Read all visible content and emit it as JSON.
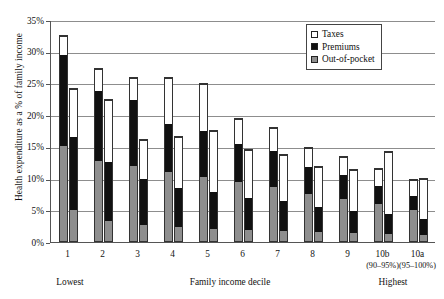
{
  "chart_data": {
    "type": "bar",
    "subtype": "grouped-stacked",
    "title": "",
    "xlabel": "Family income decile",
    "ylabel": "Health expenditure as a % of family income",
    "ylim": [
      0,
      35
    ],
    "ytick_values": [
      0,
      5,
      10,
      15,
      20,
      25,
      30,
      35
    ],
    "ytick_labels": [
      "0%",
      "5%",
      "10%",
      "15%",
      "20%",
      "25%",
      "30%",
      "35%"
    ],
    "grid": true,
    "grid_axis": "y",
    "legend_position": "top-right",
    "categories": [
      "1",
      "2",
      "3",
      "4",
      "5",
      "6",
      "7",
      "8",
      "9",
      "10b",
      "10a"
    ],
    "category_sublabels": [
      "",
      "",
      "",
      "",
      "",
      "",
      "",
      "",
      "",
      "(90–95%)",
      "(95–100%)"
    ],
    "axis_end_labels": {
      "left": "Lowest",
      "right": "Highest"
    },
    "bars_per_category": 2,
    "bar_series_names": [
      "bar-a",
      "bar-b"
    ],
    "stack_order_bottom_to_top": [
      "Out-of-pocket",
      "Premiums",
      "Taxes"
    ],
    "series": [
      {
        "name": "Out-of-pocket",
        "color": "#8e8e8e",
        "bar_a": [
          15.2,
          12.8,
          12.0,
          11.0,
          10.3,
          9.4,
          8.6,
          7.5,
          6.8,
          6.0,
          5.0
        ],
        "bar_b": [
          5.0,
          3.2,
          2.6,
          2.2,
          2.0,
          1.8,
          1.6,
          1.4,
          1.3,
          1.2,
          1.0
        ]
      },
      {
        "name": "Premiums",
        "color": "#111111",
        "bar_a": [
          14.4,
          11.2,
          10.5,
          7.6,
          7.2,
          6.2,
          5.9,
          4.5,
          3.8,
          3.0,
          2.4
        ],
        "bar_b": [
          11.6,
          9.4,
          7.3,
          6.3,
          5.9,
          5.2,
          4.8,
          4.1,
          3.6,
          3.1,
          2.6
        ]
      },
      {
        "name": "Taxes",
        "color": "#ffffff",
        "bar_a": [
          3.0,
          3.4,
          3.5,
          7.4,
          7.5,
          4.0,
          3.7,
          3.0,
          2.9,
          2.6,
          2.6
        ],
        "bar_b": [
          7.7,
          10.0,
          6.4,
          8.2,
          9.7,
          7.7,
          7.5,
          6.5,
          6.6,
          10.1,
          6.5
        ]
      }
    ],
    "totals": {
      "bar_a": [
        32.6,
        27.4,
        26.0,
        26.0,
        25.0,
        19.6,
        18.2,
        15.0,
        13.5,
        11.6,
        10.0
      ],
      "bar_b": [
        24.3,
        22.6,
        16.3,
        10.7,
        17.6,
        14.7,
        13.9,
        12.0,
        11.5,
        14.4,
        10.1
      ]
    }
  },
  "legend": {
    "items": [
      {
        "label": "Taxes",
        "swatch": "tax"
      },
      {
        "label": "Premiums",
        "swatch": "prem"
      },
      {
        "label": "Out-of-pocket",
        "swatch": "oop"
      }
    ]
  }
}
